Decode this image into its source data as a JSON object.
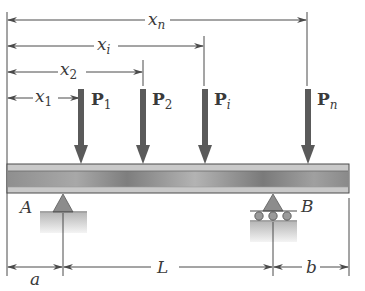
{
  "diagram": {
    "colors": {
      "line": "#4a4a4a",
      "arrow": "#5a5a5a",
      "beam_light": "#cfcfcf",
      "beam_dark": "#8a8a8a",
      "support": "#8c8c8c",
      "ground": "#c4c4c4",
      "background": "#ffffff"
    },
    "position_dimensions": [
      {
        "name": "x",
        "subscript": "n",
        "end_x": 307
      },
      {
        "name": "x",
        "subscript": "i",
        "end_x": 204
      },
      {
        "name": "x",
        "subscript": "2",
        "end_x": 143
      },
      {
        "name": "x",
        "subscript": "1",
        "end_x": 80
      }
    ],
    "loads": [
      {
        "name": "P",
        "subscript": "1",
        "x": 81
      },
      {
        "name": "P",
        "subscript": "2",
        "x": 143
      },
      {
        "name": "P",
        "subscript": "i",
        "x": 205
      },
      {
        "name": "P",
        "subscript": "n",
        "x": 308
      }
    ],
    "supports": [
      {
        "label": "A",
        "type": "pin",
        "x": 63
      },
      {
        "label": "B",
        "type": "roller",
        "x": 273
      }
    ],
    "span_dimensions": [
      {
        "label": "a",
        "from_x": 7,
        "to_x": 63
      },
      {
        "label": "L",
        "from_x": 63,
        "to_x": 273
      },
      {
        "label": "b",
        "from_x": 273,
        "to_x": 349
      }
    ]
  }
}
